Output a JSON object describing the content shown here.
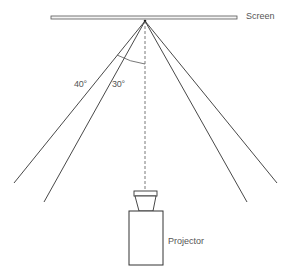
{
  "diagram": {
    "labels": {
      "screen": "Screen",
      "angle_outer": "40°",
      "angle_inner": "30°",
      "projector": "Projector"
    },
    "elements": {
      "screen": {
        "x1": 51,
        "x2": 237,
        "y": 17.5
      },
      "apex": {
        "x": 145,
        "y": 21
      },
      "rays": [
        {
          "name": "outer-left",
          "angle_deg": 40,
          "end": [
            14,
            183
          ]
        },
        {
          "name": "inner-left",
          "angle_deg": 30,
          "end": [
            44,
            202
          ]
        },
        {
          "name": "inner-right",
          "angle_deg": 30,
          "end": [
            247,
            202
          ]
        },
        {
          "name": "outer-right",
          "angle_deg": 40,
          "end": [
            277,
            183
          ]
        }
      ],
      "center_axis": {
        "style": "dashed",
        "from": [
          145,
          21
        ],
        "to": [
          145,
          190
        ]
      },
      "projector": {
        "lens": {
          "top_left": 134,
          "top_right": 157,
          "bottom_left": 139,
          "bottom_right": 153,
          "top": 191,
          "bottom": 211
        },
        "body": {
          "x": 129,
          "y": 211,
          "width": 34,
          "height": 54
        }
      }
    },
    "colors": {
      "line": "#333333",
      "text": "#555555",
      "screen_fill": "#f4f4f4"
    }
  }
}
